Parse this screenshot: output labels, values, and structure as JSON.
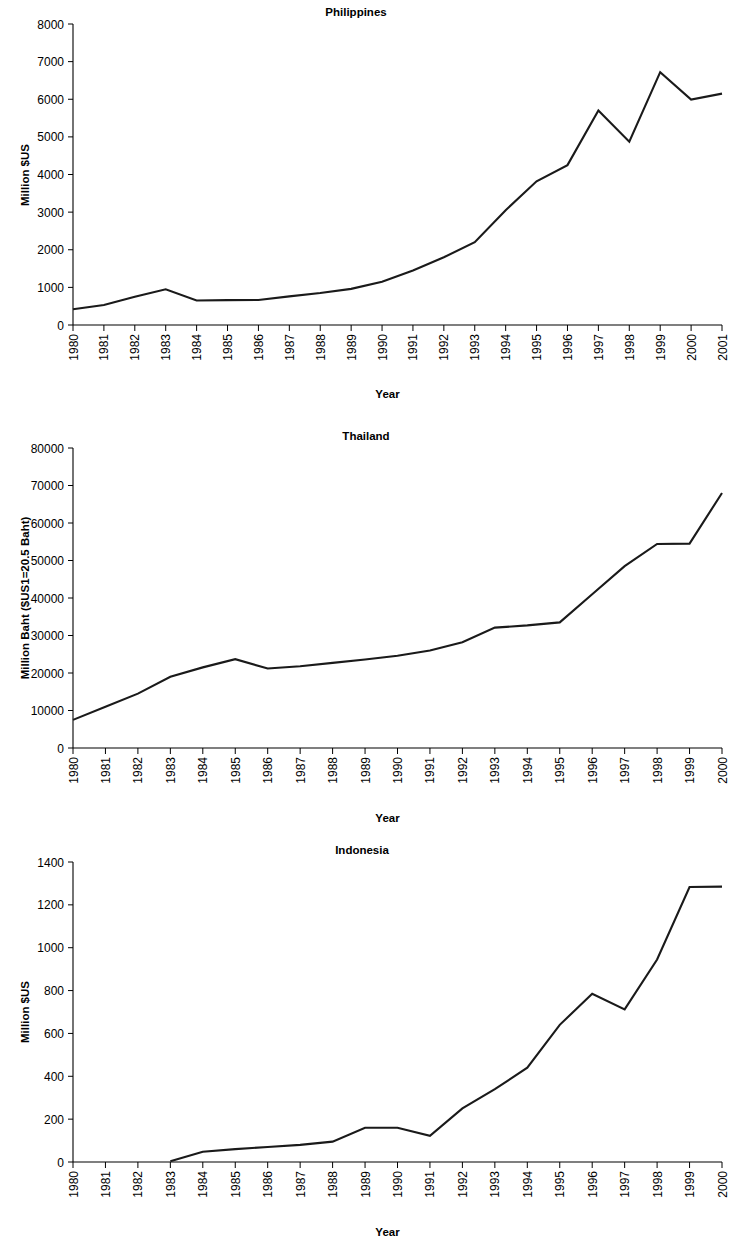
{
  "document": {
    "kind": "figure-sheet",
    "background_color": "#ffffff",
    "line_color": "#1a1a1a",
    "axis_color": "#000000"
  },
  "chart_data": [
    {
      "type": "line",
      "title": "Philippines",
      "xlabel": "Year",
      "ylabel": "Million $US",
      "categories": [
        "1980",
        "1981",
        "1982",
        "1983",
        "1984",
        "1985",
        "1986",
        "1987",
        "1988",
        "1989",
        "1990",
        "1991",
        "1992",
        "1993",
        "1994",
        "1995",
        "1996",
        "1997",
        "1998",
        "1999",
        "2000",
        "2001"
      ],
      "values": [
        420,
        530,
        750,
        950,
        650,
        660,
        665,
        760,
        850,
        960,
        1150,
        1450,
        1800,
        2200,
        3050,
        3820,
        4250,
        5700,
        4870,
        6720,
        5990,
        6150
      ],
      "ylim": [
        0,
        8000
      ],
      "yticks": [
        0,
        1000,
        2000,
        3000,
        4000,
        5000,
        6000,
        7000,
        8000
      ],
      "ytick_labels": [
        "0",
        "1000",
        "2000",
        "3000",
        "4000",
        "5000",
        "6000",
        "7000",
        "8000"
      ],
      "grid": false,
      "legend": "none"
    },
    {
      "type": "line",
      "title": "Thailand",
      "xlabel": "Year",
      "ylabel": "Million Baht ($US1=20.5 Baht)",
      "categories": [
        "1980",
        "1981",
        "1982",
        "1983",
        "1984",
        "1985",
        "1986",
        "1987",
        "1988",
        "1989",
        "1990",
        "1991",
        "1992",
        "1993",
        "1994",
        "1995",
        "1996",
        "1997",
        "1998",
        "1999",
        "2000"
      ],
      "values": [
        7500,
        11000,
        14500,
        19000,
        21500,
        23700,
        21200,
        21800,
        22700,
        23600,
        24600,
        26000,
        28200,
        32100,
        32700,
        33500,
        41000,
        48500,
        54400,
        54500,
        68000
      ],
      "ylim": [
        0,
        80000
      ],
      "yticks": [
        0,
        10000,
        20000,
        30000,
        40000,
        50000,
        60000,
        70000,
        80000
      ],
      "ytick_labels": [
        "0",
        "10000",
        "20000",
        "30000",
        "40000",
        "50000",
        "60000",
        "70000",
        "80000"
      ],
      "grid": false,
      "legend": "none"
    },
    {
      "type": "line",
      "title": "Indonesia",
      "xlabel": "Year",
      "ylabel": "Million $US",
      "categories": [
        "1980",
        "1981",
        "1982",
        "1983",
        "1984",
        "1985",
        "1986",
        "1987",
        "1988",
        "1989",
        "1990",
        "1991",
        "1992",
        "1993",
        "1994",
        "1995",
        "1996",
        "1997",
        "1998",
        "1999",
        "2000"
      ],
      "values": [
        null,
        null,
        null,
        3,
        48,
        60,
        70,
        80,
        95,
        160,
        160,
        122,
        250,
        340,
        440,
        640,
        785,
        712,
        945,
        1283,
        1285
      ],
      "ylim": [
        0,
        1400
      ],
      "yticks": [
        0,
        200,
        400,
        600,
        800,
        1000,
        1200,
        1400
      ],
      "ytick_labels": [
        "0",
        "200",
        "400",
        "600",
        "800",
        "1000",
        "1200",
        "1400"
      ],
      "grid": false,
      "legend": "none"
    }
  ]
}
